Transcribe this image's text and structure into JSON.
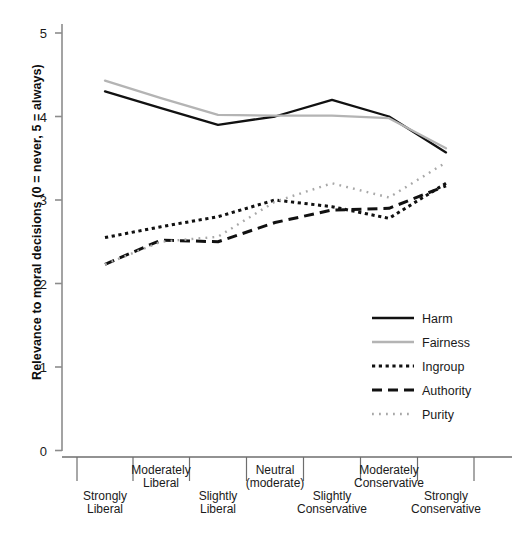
{
  "chart_data": {
    "type": "line",
    "title": "",
    "xlabel": "",
    "ylabel": "Relevance to moral decisions  (0 = never, 5 = always)",
    "ylim": [
      0,
      5
    ],
    "yticks": [
      0,
      1,
      2,
      3,
      4,
      5
    ],
    "ytick_labels": [
      "0",
      "1",
      "2",
      "3",
      "4",
      "5"
    ],
    "grid": false,
    "legend_position": "center-right",
    "categories": [
      "Strongly Liberal",
      "Moderately Liberal",
      "Slightly Liberal",
      "Neutral (moderate)",
      "Slightly Conservative",
      "Moderately Conservative",
      "Strongly Conservative"
    ],
    "category_lines": [
      [
        "Strongly",
        "Liberal"
      ],
      [
        "Moderately",
        "Liberal"
      ],
      [
        "Slightly",
        "Liberal"
      ],
      [
        "Neutral",
        "(moderate)"
      ],
      [
        "Slightly",
        "Conservative"
      ],
      [
        "Moderately",
        "Conservative"
      ],
      [
        "Strongly",
        "Conservative"
      ]
    ],
    "series": [
      {
        "name": "Harm",
        "style": "solid",
        "color": "#111111",
        "values": [
          4.3,
          4.1,
          3.9,
          4.0,
          4.2,
          4.0,
          3.57
        ]
      },
      {
        "name": "Fairness",
        "style": "solid",
        "color": "#b4b4b4",
        "values": [
          4.43,
          4.22,
          4.02,
          4.01,
          4.01,
          3.98,
          3.62
        ]
      },
      {
        "name": "Ingroup",
        "style": "dotted",
        "color": "#111111",
        "values": [
          2.55,
          2.68,
          2.8,
          3.0,
          2.92,
          2.78,
          3.2
        ]
      },
      {
        "name": "Authority",
        "style": "dashed",
        "color": "#111111",
        "values": [
          2.23,
          2.52,
          2.5,
          2.73,
          2.88,
          2.9,
          3.17
        ]
      },
      {
        "name": "Purity",
        "style": "fine-dotted",
        "color": "#a8a8a8",
        "values": [
          2.23,
          2.5,
          2.56,
          2.98,
          3.2,
          3.03,
          3.45
        ]
      }
    ]
  },
  "legend": {
    "items": [
      {
        "label": "Harm"
      },
      {
        "label": "Fairness"
      },
      {
        "label": "Ingroup"
      },
      {
        "label": "Authority"
      },
      {
        "label": "Purity"
      }
    ]
  },
  "axis": {
    "y_label_text": "Relevance to moral decisions  (0 = never, 5 = always)"
  }
}
